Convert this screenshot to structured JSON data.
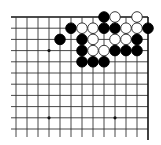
{
  "board": {
    "title": "Go problem diagram (top-right corner)",
    "background": "#ffffff",
    "line_color": "#333333",
    "edge_color": "#111111",
    "black_stone_color": "#000000",
    "white_stone_color": "#ffffff",
    "origin_x": 16,
    "origin_y": 17,
    "col_spacing": 11,
    "row_spacing": 11.2,
    "cols": 13,
    "rows": 11,
    "edges": {
      "top": true,
      "right": true,
      "left": false,
      "bottom": false
    },
    "star_points": [
      {
        "col": 3,
        "row": 3
      },
      {
        "col": 3,
        "row": 9
      },
      {
        "col": 9,
        "row": 9
      }
    ],
    "stones": [
      {
        "color": "black",
        "col": 8,
        "row": 0
      },
      {
        "color": "white",
        "col": 9,
        "row": 0
      },
      {
        "color": "white",
        "col": 11,
        "row": 0
      },
      {
        "color": "black",
        "col": 5,
        "row": 1
      },
      {
        "color": "white",
        "col": 6,
        "row": 1
      },
      {
        "color": "white",
        "col": 7,
        "row": 1
      },
      {
        "color": "black",
        "col": 8,
        "row": 1
      },
      {
        "color": "black",
        "col": 9,
        "row": 1
      },
      {
        "color": "white",
        "col": 10,
        "row": 1
      },
      {
        "color": "white",
        "col": 11,
        "row": 1
      },
      {
        "color": "black",
        "col": 12,
        "row": 1
      },
      {
        "color": "black",
        "col": 4,
        "row": 2
      },
      {
        "color": "black",
        "col": 6,
        "row": 2
      },
      {
        "color": "white",
        "col": 7,
        "row": 2
      },
      {
        "color": "white",
        "col": 9,
        "row": 2
      },
      {
        "color": "white",
        "col": 10,
        "row": 2
      },
      {
        "color": "black",
        "col": 11,
        "row": 2
      },
      {
        "color": "black",
        "col": 6,
        "row": 3
      },
      {
        "color": "white",
        "col": 7,
        "row": 3
      },
      {
        "color": "white",
        "col": 8,
        "row": 3
      },
      {
        "color": "black",
        "col": 9,
        "row": 3
      },
      {
        "color": "black",
        "col": 10,
        "row": 3
      },
      {
        "color": "black",
        "col": 11,
        "row": 3
      },
      {
        "color": "black",
        "col": 6,
        "row": 4
      },
      {
        "color": "black",
        "col": 7,
        "row": 4
      },
      {
        "color": "black",
        "col": 8,
        "row": 4
      }
    ]
  }
}
